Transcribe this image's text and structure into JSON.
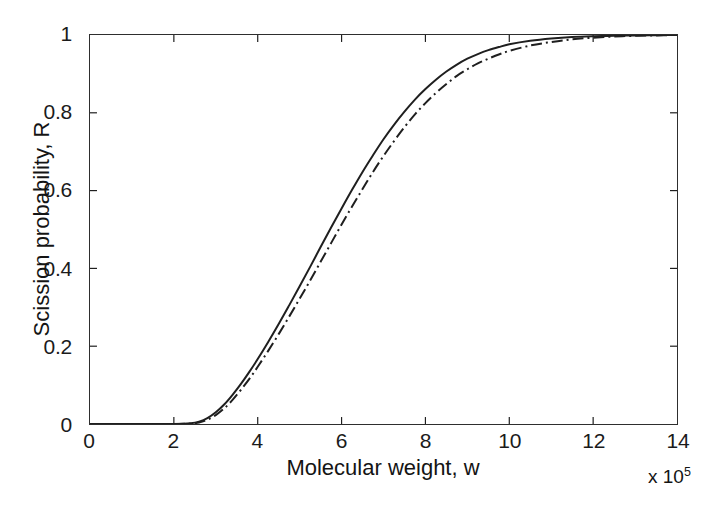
{
  "chart_data": {
    "type": "line",
    "title": "",
    "subtitle": "",
    "xlabel": "Molecular weight, w",
    "ylabel": "Scission probability, R",
    "x_multiplier": "x 10",
    "x_multiplier_exponent": "5",
    "xlim": [
      0,
      14
    ],
    "ylim": [
      0,
      1
    ],
    "grid": false,
    "legend": null,
    "xticks": [
      0,
      2,
      4,
      6,
      8,
      10,
      12,
      14
    ],
    "xticklabels": [
      "0",
      "2",
      "4",
      "6",
      "8",
      "10",
      "12",
      "14"
    ],
    "yticks": [
      0,
      0.2,
      0.4,
      0.6,
      0.8,
      1
    ],
    "yticklabels": [
      "0",
      "0.2",
      "0.4",
      "0.6",
      "0.8",
      "1"
    ],
    "line_color": "#1f1f1f",
    "x": [
      0,
      0.5,
      1,
      1.5,
      2,
      2.4,
      2.6,
      2.8,
      3,
      3.2,
      3.4,
      3.6,
      3.8,
      4,
      4.25,
      4.5,
      4.75,
      5,
      5.25,
      5.5,
      5.75,
      6,
      6.25,
      6.5,
      6.75,
      7,
      7.25,
      7.5,
      7.75,
      8,
      8.25,
      8.5,
      8.75,
      9,
      9.25,
      9.5,
      9.75,
      10,
      10.5,
      11,
      11.5,
      12,
      12.5,
      13,
      13.5,
      14
    ],
    "series": [
      {
        "name": "solid-curve",
        "style": "solid",
        "values": [
          0,
          0,
          0,
          0,
          0,
          0.002,
          0.006,
          0.015,
          0.03,
          0.05,
          0.075,
          0.103,
          0.134,
          0.167,
          0.211,
          0.257,
          0.305,
          0.354,
          0.404,
          0.455,
          0.505,
          0.554,
          0.602,
          0.648,
          0.691,
          0.732,
          0.769,
          0.803,
          0.834,
          0.861,
          0.885,
          0.906,
          0.924,
          0.939,
          0.951,
          0.961,
          0.969,
          0.976,
          0.985,
          0.991,
          0.995,
          0.997,
          0.998,
          0.999,
          0.9995,
          1.0
        ]
      },
      {
        "name": "dash-dot-curve",
        "style": "dashdot",
        "values": [
          0,
          0,
          0,
          0,
          0,
          0.001,
          0.004,
          0.011,
          0.023,
          0.04,
          0.062,
          0.088,
          0.116,
          0.147,
          0.188,
          0.231,
          0.276,
          0.322,
          0.369,
          0.417,
          0.465,
          0.513,
          0.559,
          0.604,
          0.648,
          0.689,
          0.727,
          0.763,
          0.796,
          0.825,
          0.851,
          0.874,
          0.895,
          0.912,
          0.927,
          0.939,
          0.95,
          0.959,
          0.973,
          0.982,
          0.989,
          0.993,
          0.996,
          0.998,
          0.999,
          1.0
        ]
      }
    ]
  }
}
